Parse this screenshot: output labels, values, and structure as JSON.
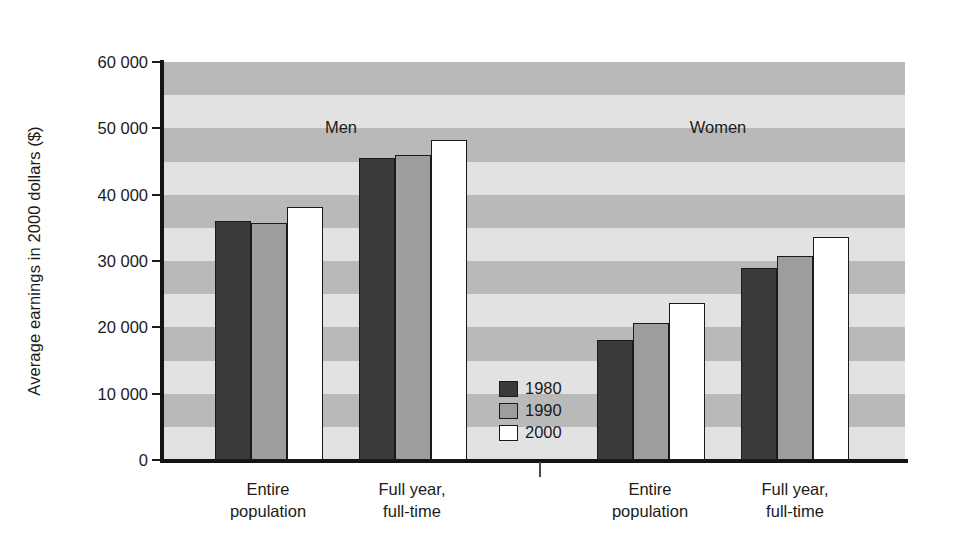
{
  "chart_data": {
    "type": "bar",
    "title": "",
    "subtitle": "",
    "xlabel": "",
    "ylabel": "Average earnings in 2000 dollars ($)",
    "ylim": [
      0,
      60000
    ],
    "ytick_labels": [
      "60 000",
      "50 000",
      "40 000",
      "30 000",
      "20 000",
      "10 000",
      "0"
    ],
    "ytick_values": [
      60000,
      50000,
      40000,
      30000,
      20000,
      10000,
      0
    ],
    "grid": false,
    "background_bands": true,
    "band_interval": 5000,
    "legend_position": "inside-center-lower",
    "legend": [
      "1980",
      "1990",
      "2000"
    ],
    "group_labels": [
      "Men",
      "Women"
    ],
    "categories": [
      "Entire population",
      "Full year, full-time"
    ],
    "panels": [
      {
        "group": "Men",
        "categories": [
          "Entire\npopulation",
          "Full year,\nfull-time"
        ],
        "series": [
          {
            "name": "1980",
            "values": [
              36000,
              45500
            ]
          },
          {
            "name": "1990",
            "values": [
              35700,
              46000
            ]
          },
          {
            "name": "2000",
            "values": [
              38200,
              48200
            ]
          }
        ]
      },
      {
        "group": "Women",
        "categories": [
          "Entire\npopulation",
          "Full year,\nfull-time"
        ],
        "series": [
          {
            "name": "1980",
            "values": [
              18100,
              29000
            ]
          },
          {
            "name": "1990",
            "values": [
              20700,
              30700
            ]
          },
          {
            "name": "2000",
            "values": [
              23700,
              33600
            ]
          }
        ]
      }
    ],
    "series_colors": {
      "1980": "#3a3a3a",
      "1990": "#9d9d9d",
      "2000": "#ffffff"
    },
    "band_colors": {
      "dark": "#b9b9b9",
      "light": "#e2e2e2"
    }
  },
  "labels": {
    "y_axis_title": "Average earnings in 2000 dollars ($)",
    "men": "Men",
    "women": "Women",
    "cat_entire_line1": "Entire",
    "cat_entire_line2": "population",
    "cat_fullyear_line1": "Full year,",
    "cat_fullyear_line2": "full-time",
    "legend_1980": "1980",
    "legend_1990": "1990",
    "legend_2000": "2000",
    "y_60000": "60 000",
    "y_50000": "50 000",
    "y_40000": "40 000",
    "y_30000": "30 000",
    "y_20000": "20 000",
    "y_10000": "10 000",
    "y_0": "0"
  }
}
